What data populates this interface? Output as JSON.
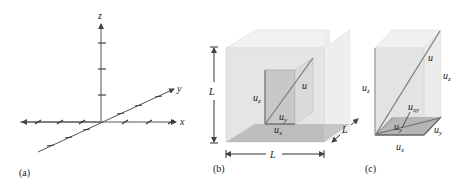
{
  "figure": {
    "panels": [
      {
        "id": "a",
        "caption": "(a)",
        "description": "3D coordinate axes with tick marks",
        "axes": {
          "x": "x",
          "y": "y",
          "z": "z"
        }
      },
      {
        "id": "b",
        "caption": "(b)",
        "description": "Cube of side L containing a velocity vector u with components",
        "dimension_labels": {
          "height": "L",
          "width": "L",
          "depth": "L"
        },
        "vector": "u",
        "components": {
          "z": "u",
          "z_sub": "z",
          "y": "u",
          "y_sub": "y",
          "x": "u",
          "x_sub": "x"
        }
      },
      {
        "id": "c",
        "caption": "(c)",
        "description": "Rectangular box showing vector u decomposed into u_z and u_xy",
        "vector": "u",
        "labels": {
          "uz_left": "u",
          "uz_left_sub": "z",
          "uz_right": "u",
          "uz_right_sub": "z",
          "uxy": "u",
          "uxy_sub": "xy",
          "uy_inner": "u",
          "uy_inner_sub": "y",
          "uy_side": "u",
          "uy_side_sub": "y",
          "ux": "u",
          "ux_sub": "x"
        }
      }
    ]
  },
  "colors": {
    "box_face": "#e6e6e6",
    "box_top": "#efefef",
    "floor": "#bdbdbd",
    "inner_rect": "#c9c9c9",
    "line": "#555555"
  }
}
